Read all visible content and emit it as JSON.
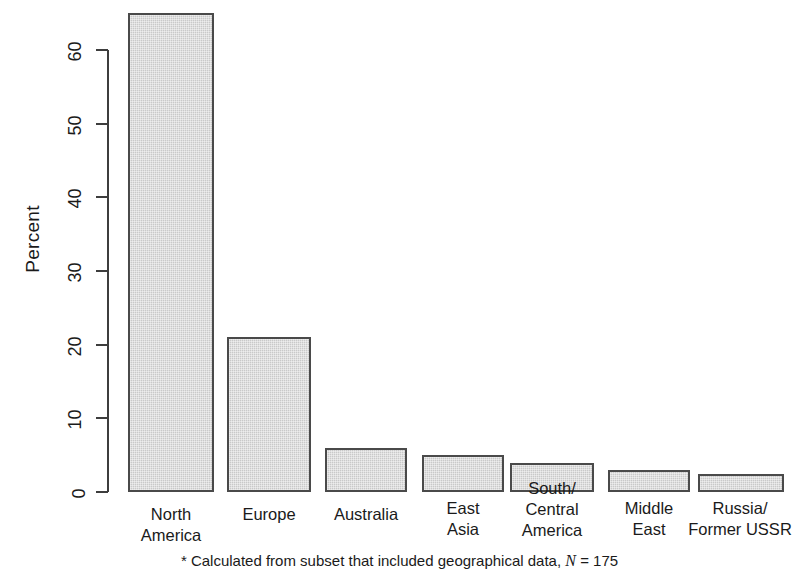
{
  "chart_data": {
    "type": "bar",
    "title": "",
    "xlabel": "",
    "ylabel": "Percent",
    "ylim": [
      0,
      65
    ],
    "yticks": [
      0,
      10,
      20,
      30,
      40,
      50,
      60
    ],
    "grid": false,
    "legend": "none",
    "categories": [
      "North\nAmerica",
      "Europe",
      "Australia",
      "East\nAsia",
      "South/\nCentral\nAmerica",
      "Middle\nEast",
      "Russia/\nFormer USSR"
    ],
    "values": [
      65,
      21,
      6,
      5,
      4,
      3,
      2.5
    ],
    "annotations": [
      "* Calculated from subset that included geographical data, N = 175"
    ]
  },
  "axis": {
    "y_title": "Percent",
    "tick_labels": [
      "0",
      "10",
      "20",
      "30",
      "40",
      "50",
      "60"
    ]
  },
  "footnote": {
    "prefix": "* Calculated from subset that included geographical data, ",
    "n_symbol": "N",
    "n_value": " = 175"
  },
  "colors": {
    "bar_fill": "#c9c9c9",
    "bar_border": "#4a4a4a",
    "axis": "#3d3d3d",
    "text": "#1a1a1a",
    "background": "#ffffff"
  }
}
